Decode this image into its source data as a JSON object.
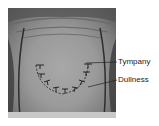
{
  "figure": {
    "labels": [
      {
        "id": "tympany",
        "text": "Tympany"
      },
      {
        "id": "dullness",
        "text": "Dullness"
      }
    ],
    "colors": {
      "skin_light": "#a8a8a8",
      "skin_dark": "#4e4e4e",
      "marker": "#1a1a1a",
      "label_text": "#222222"
    }
  }
}
